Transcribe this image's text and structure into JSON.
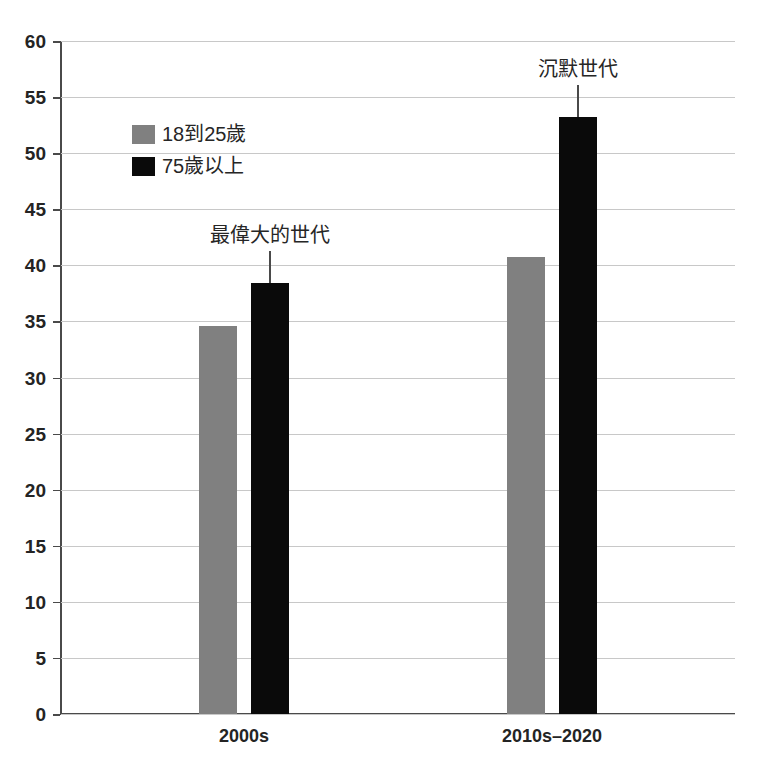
{
  "chart_data": {
    "type": "bar",
    "title": "",
    "subtitle": "",
    "xlabel": "",
    "ylabel": "",
    "categories": [
      "2000s",
      "2010s–2020"
    ],
    "series": [
      {
        "name": "18到25歲",
        "color": "#808080",
        "values": [
          34.6,
          40.7
        ]
      },
      {
        "name": "75歲以上",
        "color": "#0a0a0a",
        "values": [
          38.4,
          53.2
        ]
      }
    ],
    "ylim": [
      0,
      60
    ],
    "ytick_step": 5,
    "yticks": [
      60,
      55,
      50,
      45,
      40,
      35,
      30,
      25,
      20,
      15,
      10,
      5,
      0
    ],
    "ytick_labels": [
      "60",
      "55",
      "50",
      "45",
      "40",
      "35",
      "30",
      "25",
      "20",
      "15",
      "10",
      "5",
      "0"
    ],
    "grid": true,
    "grid_axis": "y",
    "legend_position": "upper-left-inside",
    "annotations": [
      {
        "text": "最偉大的世代",
        "target_category": "2000s",
        "target_series": "75歲以上",
        "target_value": 38.4
      },
      {
        "text": "沉默世代",
        "target_category": "2010s–2020",
        "target_series": "75歲以上",
        "target_value": 53.2
      }
    ]
  },
  "colors": {
    "series_gray": "#808080",
    "series_black": "#0a0a0a",
    "axis": "#4a4a4a",
    "gridline": "#c8c8c8",
    "text": "#242424",
    "background": "#ffffff"
  }
}
